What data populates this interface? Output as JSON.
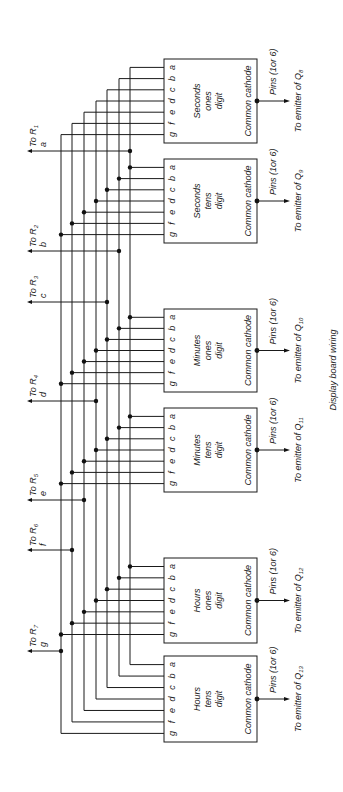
{
  "caption": "Display board wiring",
  "colors": {
    "ink": "#1a1a1a",
    "background": "#ffffff"
  },
  "segments": [
    "a",
    "b",
    "c",
    "d",
    "e",
    "f",
    "g"
  ],
  "segment_label_order": "g f e d c b a",
  "bus_lines": [
    {
      "segment": "a",
      "resistor": "R",
      "resistor_sub": "1",
      "to_label": "To",
      "x": 130,
      "out_y": 151
    },
    {
      "segment": "b",
      "resistor": "R",
      "resistor_sub": "2",
      "to_label": "To",
      "x": 119,
      "out_y": 251
    },
    {
      "segment": "c",
      "resistor": "R",
      "resistor_sub": "3",
      "to_label": "To",
      "x": 107,
      "out_y": 302
    },
    {
      "segment": "d",
      "resistor": "R",
      "resistor_sub": "4",
      "to_label": "To",
      "x": 96,
      "out_y": 401
    },
    {
      "segment": "e",
      "resistor": "R",
      "resistor_sub": "5",
      "to_label": "To",
      "x": 84,
      "out_y": 500
    },
    {
      "segment": "f",
      "resistor": "R",
      "resistor_sub": "6",
      "to_label": "To",
      "x": 72,
      "out_y": 550
    },
    {
      "segment": "g",
      "resistor": "R",
      "resistor_sub": "7",
      "to_label": "To",
      "x": 61,
      "out_y": 651
    }
  ],
  "digits": [
    {
      "name_line1": "Seconds",
      "name_line2": "ones",
      "name_line3": "digit",
      "cathode": "Common cathode",
      "pins": "Pins (1or 6)",
      "emitter": "To emitter of Q",
      "emitter_sub": "8",
      "top": 59,
      "bottom": 143
    },
    {
      "name_line1": "Seconds",
      "name_line2": "tens",
      "name_line3": "digit",
      "cathode": "Common cathode",
      "pins": "Pins (1or 6)",
      "emitter": "To emitter of Q",
      "emitter_sub": "9",
      "top": 159,
      "bottom": 243
    },
    {
      "name_line1": "Minutes",
      "name_line2": "ones",
      "name_line3": "digit",
      "cathode": "Common cathode",
      "pins": "Pins (1or 6)",
      "emitter": "To emitter of Q",
      "emitter_sub": "10",
      "top": 309,
      "bottom": 392
    },
    {
      "name_line1": "Minutes",
      "name_line2": "tens",
      "name_line3": "digit",
      "cathode": "Common cathode",
      "pins": "Pins (1or 6)",
      "emitter": "To emitter of Q",
      "emitter_sub": "11",
      "top": 408,
      "bottom": 492
    },
    {
      "name_line1": "Hours",
      "name_line2": "ones",
      "name_line3": "digit",
      "cathode": "Common cathode",
      "pins": "Pins (1or 6)",
      "emitter": "To emitter of Q",
      "emitter_sub": "12",
      "top": 558,
      "bottom": 643
    },
    {
      "name_line1": "Hours",
      "name_line2": "tens",
      "name_line3": "digit",
      "cathode": "Common cathode",
      "pins": "Pins (1or 6)",
      "emitter": "To emitter of Q",
      "emitter_sub": "13",
      "top": 656,
      "bottom": 742
    }
  ]
}
